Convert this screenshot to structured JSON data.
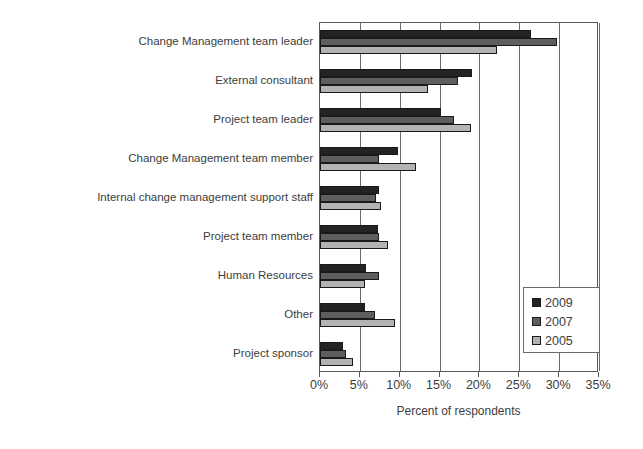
{
  "chart_data": {
    "type": "bar",
    "orientation": "horizontal",
    "title": "",
    "xlabel": "Percent of respondents",
    "ylabel": "",
    "xlim": [
      0,
      35
    ],
    "xunit": "%",
    "grid": true,
    "legend_position": "inside-right",
    "xticks": [
      "0%",
      "5%",
      "10%",
      "15%",
      "20%",
      "25%",
      "30%",
      "35%"
    ],
    "xtickvalues": [
      0,
      5,
      10,
      15,
      20,
      25,
      30,
      35
    ],
    "categories": [
      "Change Management team leader",
      "External consultant",
      "Project team leader",
      "Change Management team member",
      "Internal change management support staff",
      "Project team member",
      "Human Resources",
      "Other",
      "Project sponsor"
    ],
    "series": [
      {
        "name": "2009",
        "color": "#232323",
        "values": [
          26.5,
          19.1,
          15.2,
          9.8,
          7.4,
          7.3,
          5.8,
          5.6,
          2.9
        ]
      },
      {
        "name": "2007",
        "color": "#5e5e5e",
        "values": [
          29.7,
          17.3,
          16.8,
          7.4,
          7.0,
          7.4,
          7.4,
          6.9,
          3.3
        ]
      },
      {
        "name": "2005",
        "color": "#b3b3b3",
        "values": [
          22.2,
          13.6,
          19.0,
          12.0,
          7.7,
          8.5,
          5.6,
          9.4,
          4.2
        ]
      }
    ]
  },
  "legend": {
    "items": [
      {
        "label": "2009",
        "color": "#232323"
      },
      {
        "label": "2007",
        "color": "#5e5e5e"
      },
      {
        "label": "2005",
        "color": "#b3b3b3"
      }
    ]
  }
}
